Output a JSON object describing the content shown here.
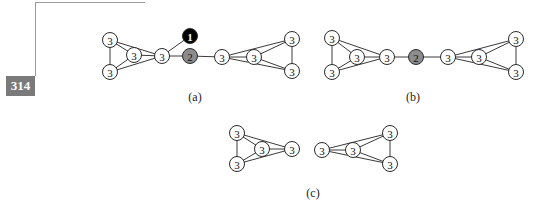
{
  "page": {
    "number": "314"
  },
  "colors": {
    "default_node": "#ffffff",
    "gray_node": "#8c8c8c",
    "black_node": "#000000",
    "edge": "#3a3a3a"
  },
  "figures": [
    {
      "id": "a",
      "label": "(a)",
      "label_pos": [
        195,
        101
      ],
      "nodes": [
        {
          "id": "a1",
          "x": 110,
          "y": 40,
          "value": "3",
          "fill": "white"
        },
        {
          "id": "a2",
          "x": 134,
          "y": 55,
          "value": "3",
          "fill": "white"
        },
        {
          "id": "a3",
          "x": 110,
          "y": 72,
          "value": "3",
          "fill": "white"
        },
        {
          "id": "a4",
          "x": 162,
          "y": 56,
          "value": "3",
          "fill": "white"
        },
        {
          "id": "a5",
          "x": 190,
          "y": 36,
          "value": "1",
          "fill": "black"
        },
        {
          "id": "a6",
          "x": 190,
          "y": 56,
          "value": "2",
          "fill": "gray"
        },
        {
          "id": "a7",
          "x": 222,
          "y": 57,
          "value": "3",
          "fill": "white"
        },
        {
          "id": "a8",
          "x": 254,
          "y": 57,
          "value": "3",
          "fill": "white"
        },
        {
          "id": "a9",
          "x": 292,
          "y": 39,
          "value": "3",
          "fill": "white"
        },
        {
          "id": "a10",
          "x": 292,
          "y": 71,
          "value": "3",
          "fill": "white"
        }
      ],
      "edges": [
        [
          "a1",
          "a3"
        ],
        [
          "a1",
          "a2"
        ],
        [
          "a1",
          "a4"
        ],
        [
          "a3",
          "a2"
        ],
        [
          "a3",
          "a4"
        ],
        [
          "a2",
          "a4"
        ],
        [
          "a4",
          "a5"
        ],
        [
          "a4",
          "a6"
        ],
        [
          "a6",
          "a7"
        ],
        [
          "a7",
          "a8"
        ],
        [
          "a7",
          "a9"
        ],
        [
          "a7",
          "a10"
        ],
        [
          "a8",
          "a9"
        ],
        [
          "a8",
          "a10"
        ],
        [
          "a9",
          "a10"
        ]
      ]
    },
    {
      "id": "b",
      "label": "(b)",
      "label_pos": [
        413,
        101
      ],
      "nodes": [
        {
          "id": "b1",
          "x": 332,
          "y": 38,
          "value": "3",
          "fill": "white"
        },
        {
          "id": "b2",
          "x": 357,
          "y": 57,
          "value": "3",
          "fill": "white"
        },
        {
          "id": "b3",
          "x": 332,
          "y": 72,
          "value": "3",
          "fill": "white"
        },
        {
          "id": "b4",
          "x": 387,
          "y": 57,
          "value": "3",
          "fill": "white"
        },
        {
          "id": "b5",
          "x": 416,
          "y": 57,
          "value": "2",
          "fill": "gray"
        },
        {
          "id": "b6",
          "x": 448,
          "y": 57,
          "value": "3",
          "fill": "white"
        },
        {
          "id": "b7",
          "x": 479,
          "y": 57,
          "value": "3",
          "fill": "white"
        },
        {
          "id": "b8",
          "x": 516,
          "y": 39,
          "value": "3",
          "fill": "white"
        },
        {
          "id": "b9",
          "x": 516,
          "y": 72,
          "value": "3",
          "fill": "white"
        }
      ],
      "edges": [
        [
          "b1",
          "b3"
        ],
        [
          "b1",
          "b2"
        ],
        [
          "b1",
          "b4"
        ],
        [
          "b3",
          "b2"
        ],
        [
          "b3",
          "b4"
        ],
        [
          "b2",
          "b4"
        ],
        [
          "b4",
          "b5"
        ],
        [
          "b5",
          "b6"
        ],
        [
          "b6",
          "b7"
        ],
        [
          "b6",
          "b8"
        ],
        [
          "b6",
          "b9"
        ],
        [
          "b7",
          "b8"
        ],
        [
          "b7",
          "b9"
        ],
        [
          "b8",
          "b9"
        ]
      ]
    },
    {
      "id": "c",
      "label": "(c)",
      "label_pos": [
        313,
        197
      ],
      "nodes": [
        {
          "id": "c1",
          "x": 237,
          "y": 133,
          "value": "3",
          "fill": "white"
        },
        {
          "id": "c2",
          "x": 262,
          "y": 149,
          "value": "3",
          "fill": "white"
        },
        {
          "id": "c3",
          "x": 237,
          "y": 164,
          "value": "3",
          "fill": "white"
        },
        {
          "id": "c4",
          "x": 292,
          "y": 149,
          "value": "3",
          "fill": "white"
        },
        {
          "id": "c5",
          "x": 322,
          "y": 150,
          "value": "3",
          "fill": "white"
        },
        {
          "id": "c6",
          "x": 353,
          "y": 150,
          "value": "3",
          "fill": "white"
        },
        {
          "id": "c7",
          "x": 390,
          "y": 133,
          "value": "3",
          "fill": "white"
        },
        {
          "id": "c8",
          "x": 390,
          "y": 164,
          "value": "3",
          "fill": "white"
        }
      ],
      "edges": [
        [
          "c1",
          "c3"
        ],
        [
          "c1",
          "c2"
        ],
        [
          "c1",
          "c4"
        ],
        [
          "c3",
          "c2"
        ],
        [
          "c3",
          "c4"
        ],
        [
          "c2",
          "c4"
        ],
        [
          "c5",
          "c6"
        ],
        [
          "c5",
          "c7"
        ],
        [
          "c5",
          "c8"
        ],
        [
          "c6",
          "c7"
        ],
        [
          "c6",
          "c8"
        ],
        [
          "c7",
          "c8"
        ]
      ]
    }
  ]
}
